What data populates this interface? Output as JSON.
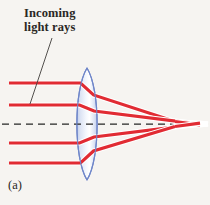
{
  "figure": {
    "panel_label": "(a)",
    "annotation": {
      "line1": "Incoming",
      "line2": "light rays",
      "full_text": "Incoming light rays"
    },
    "caption_hidden": "Converging biconvex lens focusing parallel rays with spherical aberration",
    "colors": {
      "background": "#f6f4f1",
      "ray": "#e12b33",
      "ray_highlight": "#ffffff",
      "lens_stroke": "#6f86c9",
      "lens_fill_light": "#ffffff",
      "lens_fill_mid": "#dde4f4",
      "lens_fill_edge": "#c3cfec",
      "axis": "#262626",
      "leader": "#4a4744",
      "text": "#2a2724"
    },
    "optics": {
      "lens_type": "biconvex converging",
      "lens_center_x": 87,
      "lens_top_y": 68,
      "lens_bottom_y": 180,
      "lens_half_width": 13,
      "optical_axis_y": 124,
      "ray_count": 4,
      "ray_entry_y": [
        83,
        105,
        143,
        163
      ],
      "focus_points_x": [
        175,
        196
      ],
      "aberration": "spherical"
    },
    "axis": {
      "dash_pattern": "7,5",
      "start_x": 2,
      "end_x": 208
    },
    "leader_line": {
      "from_x": 52,
      "from_y": 38,
      "to_x": 30,
      "to_y": 103
    }
  }
}
